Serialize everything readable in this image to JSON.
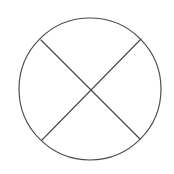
{
  "figure": {
    "type": "geometric-diagram",
    "background_color": "#ffffff",
    "stroke_color": "#4a4a4a",
    "stroke_width": 1.15,
    "canvas": {
      "width": 174,
      "height": 174
    },
    "circle": {
      "label": "outer-circle",
      "center_x": 90,
      "center_y": 89,
      "radius": 71
    },
    "chords": [
      {
        "label": "chord-upper-left-to-lower-right",
        "x1": 41,
        "y1": 40,
        "x2": 140,
        "y2": 139
      },
      {
        "label": "chord-upper-right-to-lower-left",
        "x1": 141,
        "y1": 39,
        "x2": 42,
        "y2": 140
      }
    ],
    "intersection": {
      "label": "chord-intersection-point",
      "x": 90,
      "y": 89
    },
    "vertices": [
      {
        "label": "vertex-upper-left",
        "x": 41,
        "y": 40,
        "angle_deg": 135
      },
      {
        "label": "vertex-upper-right",
        "x": 141,
        "y": 39,
        "angle_deg": 45
      },
      {
        "label": "vertex-lower-right",
        "x": 140,
        "y": 139,
        "angle_deg": 315
      },
      {
        "label": "vertex-lower-left",
        "x": 42,
        "y": 140,
        "angle_deg": 225
      }
    ],
    "sectors": [
      {
        "label": "sector-top"
      },
      {
        "label": "sector-right"
      },
      {
        "label": "sector-bottom"
      },
      {
        "label": "sector-left"
      }
    ]
  }
}
